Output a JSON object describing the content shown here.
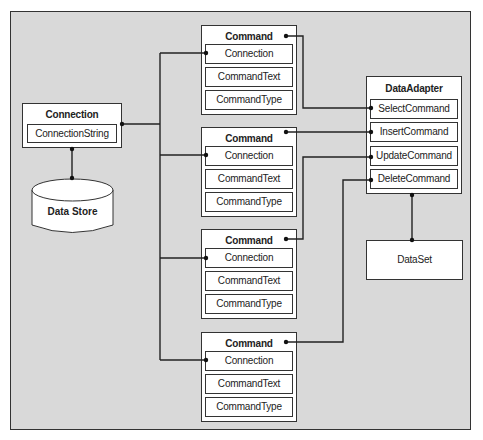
{
  "diagram": {
    "connection": {
      "title": "Connection",
      "fields": [
        "ConnectionString"
      ]
    },
    "data_store": {
      "label": "Data Store"
    },
    "commands": [
      {
        "title": "Command",
        "fields": [
          "Connection",
          "CommandText",
          "CommandType"
        ]
      },
      {
        "title": "Command",
        "fields": [
          "Connection",
          "CommandText",
          "CommandType"
        ]
      },
      {
        "title": "Command",
        "fields": [
          "Connection",
          "CommandText",
          "CommandType"
        ]
      },
      {
        "title": "Command",
        "fields": [
          "Connection",
          "CommandText",
          "CommandType"
        ]
      }
    ],
    "data_adapter": {
      "title": "DataAdapter",
      "fields": [
        "SelectCommand",
        "InsertCommand",
        "UpdateCommand",
        "DeleteCommand"
      ]
    },
    "data_set": {
      "label": "DataSet"
    },
    "colors": {
      "background": "#d9d9d9",
      "box": "#ffffff",
      "line": "#222222"
    }
  }
}
